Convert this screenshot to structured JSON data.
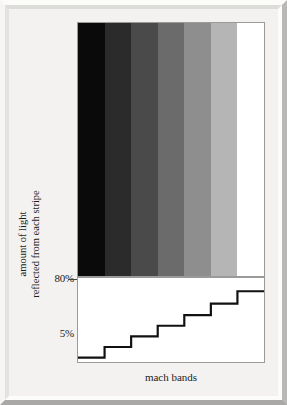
{
  "figure": {
    "caption": "mach bands",
    "y_axis_title_line1": "amount of light",
    "y_axis_title_line2": "reflected from each stripe",
    "y_tick_top": "80%",
    "y_tick_bottom": "5%"
  },
  "chart_data": {
    "type": "bar",
    "title": "mach bands",
    "xlabel": "mach bands",
    "ylabel": "amount of light reflected from each stripe",
    "categories": [
      "1",
      "2",
      "3",
      "4",
      "5",
      "6",
      "7"
    ],
    "values": [
      5,
      17,
      29,
      41,
      53,
      66,
      80
    ],
    "tick_labels": [
      "5%",
      "80%"
    ],
    "ylim": [
      0,
      95
    ],
    "grid": false,
    "legend": null,
    "annotations": "Step function showing luminance of each grey stripe increasing from 5% to 80% reflectance.",
    "stripe_colors": [
      "#0a0a0a",
      "#2b2b2b",
      "#4a4a4a",
      "#6b6b6b",
      "#8e8e8e",
      "#b5b5b5",
      "#ffffff"
    ],
    "stripe_labels": [
      "stripe-1-darkest",
      "stripe-2",
      "stripe-3",
      "stripe-4",
      "stripe-5",
      "stripe-6",
      "stripe-7-lightest"
    ]
  },
  "colors": {
    "mat": "#f3f2f0",
    "panel_border": "#9b9a98",
    "step_line": "#111111",
    "text": "#1b1b1b"
  }
}
